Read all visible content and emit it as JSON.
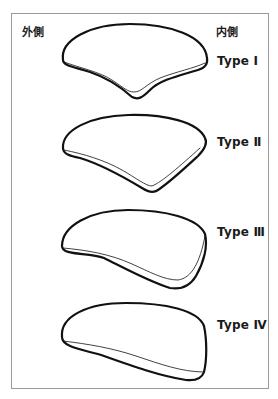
{
  "figure": {
    "lateral_label": "外側",
    "medial_label": "内側",
    "types": [
      {
        "label": "Type Ⅰ",
        "shape": "v-notched-crescent"
      },
      {
        "label": "Type Ⅱ",
        "shape": "wedge-crescent"
      },
      {
        "label": "Type Ⅲ",
        "shape": "tapered-crescent"
      },
      {
        "label": "Type Ⅳ",
        "shape": "flat-crescent"
      }
    ],
    "colors": {
      "outline": "#111111",
      "frame": "#9a9a9a",
      "background": "#ffffff"
    }
  }
}
